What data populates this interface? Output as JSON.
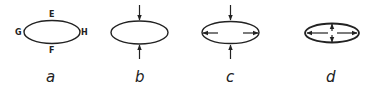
{
  "figure": {
    "panels": [
      {
        "id": "a",
        "caption": "a",
        "description": "ellipse with labeled points",
        "points": {
          "top": "E",
          "bottom": "F",
          "left": "G",
          "right": "H"
        }
      },
      {
        "id": "b",
        "caption": "b",
        "description": "ellipse with inward vertical compression arrows at top and bottom"
      },
      {
        "id": "c",
        "caption": "c",
        "description": "ellipse with inward vertical arrows outside and outward horizontal arrows inside"
      },
      {
        "id": "d",
        "caption": "d",
        "description": "flattened ellipse with outward horizontal and vertical arrows from center"
      }
    ],
    "stroke_color": "#222222",
    "background": "#ffffff"
  }
}
